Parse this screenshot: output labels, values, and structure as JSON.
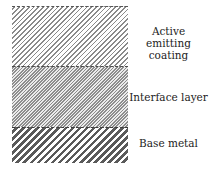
{
  "diagram": {
    "layers": [
      {
        "name": "Active emitting coating",
        "label_lines": [
          "Active emitting",
          "coating"
        ],
        "pattern": "fine diagonal hatch"
      },
      {
        "name": "Interface layer",
        "label_lines": [
          "Interface layer"
        ],
        "pattern": "dense diagonal hatch"
      },
      {
        "name": "Base metal",
        "label_lines": [
          "Base metal"
        ],
        "pattern": "coarse diagonal hatch"
      }
    ],
    "colors": {
      "line": "#555555",
      "background": "#ffffff"
    }
  }
}
